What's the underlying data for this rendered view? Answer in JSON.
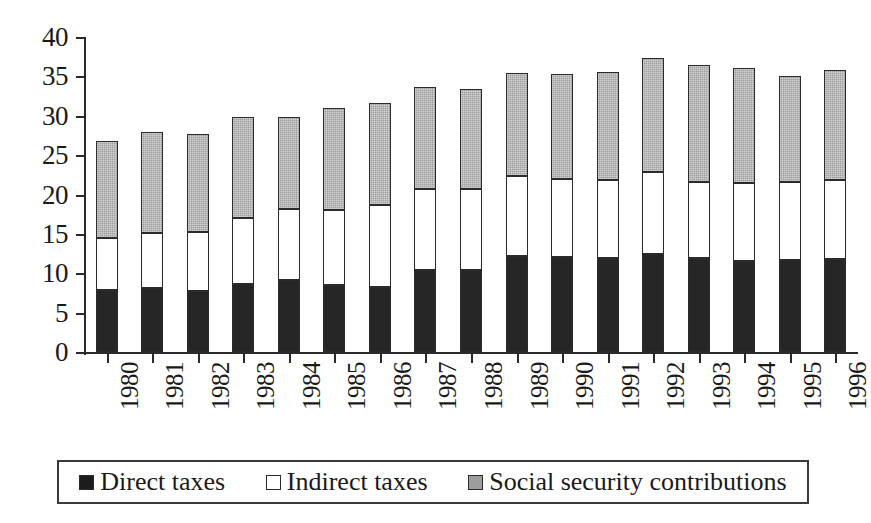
{
  "chart_data": {
    "type": "bar",
    "subtype": "stacked-bar",
    "title": "",
    "xlabel": "",
    "ylabel": "",
    "ylim": [
      0,
      40
    ],
    "yticks": [
      0,
      5,
      10,
      15,
      20,
      25,
      30,
      35,
      40
    ],
    "grid": false,
    "legend_position": "bottom",
    "categories": [
      "1980",
      "1981",
      "1982",
      "1983",
      "1984",
      "1985",
      "1986",
      "1987",
      "1988",
      "1989",
      "1990",
      "1991",
      "1992",
      "1993",
      "1994",
      "1995",
      "1996"
    ],
    "series": [
      {
        "name": "Direct taxes",
        "color": "#262626",
        "values": [
          7.9,
          8.1,
          7.7,
          8.6,
          9.2,
          8.5,
          8.3,
          10.4,
          10.4,
          12.2,
          12.1,
          12.0,
          12.5,
          12.0,
          11.6,
          11.7,
          11.8
        ]
      },
      {
        "name": "Indirect taxes",
        "color": "#ffffff",
        "values": [
          6.6,
          7.0,
          7.5,
          8.4,
          8.9,
          9.5,
          10.4,
          10.3,
          10.3,
          10.2,
          9.9,
          9.8,
          10.3,
          9.6,
          9.9,
          9.9,
          10.1
        ]
      },
      {
        "name": "Social security contributions",
        "color": "#9d9d9d",
        "values": [
          12.3,
          12.8,
          12.5,
          12.9,
          11.8,
          13.0,
          12.9,
          12.9,
          12.7,
          13.0,
          13.3,
          13.7,
          14.5,
          14.8,
          14.6,
          13.5,
          13.9
        ]
      }
    ],
    "totals": [
      26.8,
      27.9,
      27.7,
      29.9,
      29.9,
      31.0,
      31.6,
      33.6,
      33.4,
      35.4,
      35.3,
      35.5,
      37.3,
      36.4,
      36.1,
      35.1,
      35.8
    ]
  },
  "legend": {
    "items": [
      {
        "label": "Direct taxes",
        "swatch": "black-square-swatch"
      },
      {
        "label": "Indirect taxes",
        "swatch": "white-square-swatch"
      },
      {
        "label": "Social security contributions",
        "swatch": "gray-square-swatch"
      }
    ]
  }
}
